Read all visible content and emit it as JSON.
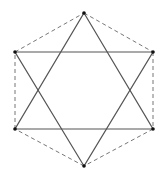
{
  "diagram": {
    "type": "hexagram-in-hexagon",
    "width": 160,
    "height": 174,
    "colors": {
      "background": "#ffffff",
      "solid_line": "#555555",
      "dashed_line": "#777777",
      "vertex": "#111111"
    },
    "vertices": [
      {
        "id": "top",
        "x": 84,
        "y": 13
      },
      {
        "id": "upper-right",
        "x": 153,
        "y": 52
      },
      {
        "id": "lower-right",
        "x": 153,
        "y": 129
      },
      {
        "id": "bottom",
        "x": 84,
        "y": 166
      },
      {
        "id": "lower-left",
        "x": 15,
        "y": 129
      },
      {
        "id": "upper-left",
        "x": 15,
        "y": 52
      }
    ],
    "triangles": [
      {
        "id": "upward-triangle",
        "vertices": [
          "top",
          "lower-right",
          "lower-left"
        ],
        "style": "solid"
      },
      {
        "id": "downward-triangle",
        "vertices": [
          "bottom",
          "upper-left",
          "upper-right"
        ],
        "style": "solid"
      }
    ],
    "hexagon": {
      "id": "outer-hexagon",
      "style": "dashed",
      "vertices": [
        "top",
        "upper-right",
        "lower-right",
        "bottom",
        "lower-left",
        "upper-left"
      ]
    }
  }
}
